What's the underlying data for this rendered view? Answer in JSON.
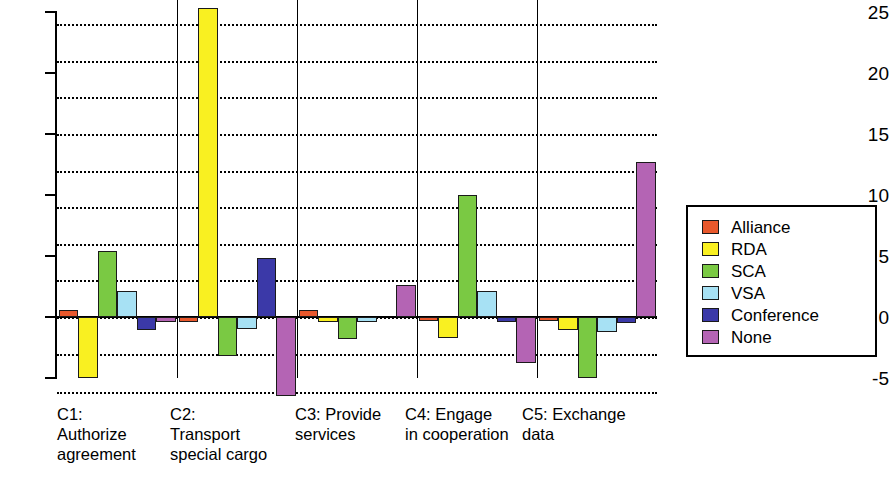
{
  "chart_data": {
    "type": "bar",
    "title": "",
    "xlabel": "",
    "ylabel": "",
    "ylim": [
      -5,
      25
    ],
    "yticks": [
      -5,
      0,
      5,
      10,
      15,
      20,
      25
    ],
    "ytick_labels": [
      "-5",
      "0",
      "5",
      "10",
      "15",
      "20",
      "25"
    ],
    "grid": true,
    "gridlines": [
      -3,
      0,
      3,
      6,
      9,
      12,
      15,
      18,
      21,
      24
    ],
    "legend_position": "right",
    "categories": [
      "C1:\nAuthorize\nagreement",
      "C2:\nTransport\nspecial cargo",
      "C3: Provide\nservices",
      "C4: Engage\nin cooperation",
      "C5: Exchange\ndata"
    ],
    "series": [
      {
        "name": "Alliance",
        "color": "#e8582c",
        "values": [
          0.6,
          -0.4,
          0.6,
          -0.3,
          -0.3
        ]
      },
      {
        "name": "RDA",
        "color": "#f9f021",
        "values": [
          -5.0,
          25.3,
          -0.4,
          -1.7,
          -1.1
        ]
      },
      {
        "name": "SCA",
        "color": "#7ac943",
        "values": [
          5.4,
          -3.2,
          -1.8,
          10.0,
          -5.0
        ]
      },
      {
        "name": "VSA",
        "color": "#a7e1f4",
        "values": [
          2.1,
          -1.0,
          -0.4,
          2.1,
          -1.2
        ]
      },
      {
        "name": "Conference",
        "color": "#3b39a8",
        "values": [
          -1.1,
          4.8,
          0.0,
          -0.4,
          -0.5
        ]
      },
      {
        "name": "None",
        "color": "#b464b4",
        "values": [
          -0.4,
          -6.5,
          2.6,
          -3.8,
          12.7
        ]
      }
    ]
  },
  "legend": {
    "items": [
      {
        "label": "Alliance"
      },
      {
        "label": "RDA"
      },
      {
        "label": "SCA"
      },
      {
        "label": "VSA"
      },
      {
        "label": "Conference"
      },
      {
        "label": "None"
      }
    ]
  }
}
